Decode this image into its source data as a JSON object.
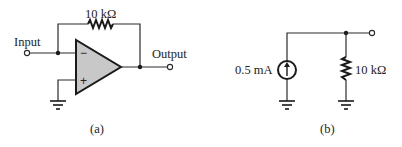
{
  "figure": {
    "panel_a": {
      "caption": "(a)",
      "feedback_resistor_label": "10 kΩ",
      "input_label": "Input",
      "output_label": "Output",
      "inverting_sign": "−",
      "noninverting_sign": "+",
      "opamp_fill": "#c8c8c8"
    },
    "panel_b": {
      "caption": "(b)",
      "current_source_label": "0.5 mA",
      "resistor_label": "10 kΩ"
    },
    "colors": {
      "line": "#2a2a2a",
      "background": "#ffffff"
    }
  }
}
